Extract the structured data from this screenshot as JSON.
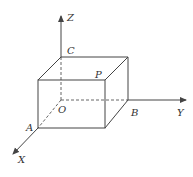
{
  "diagram": {
    "type": "3d-coordinate-box",
    "axes": {
      "z": "Z",
      "y": "Y",
      "x": "X"
    },
    "points": {
      "origin": "O",
      "a": "A",
      "b": "B",
      "c": "C",
      "p": "P"
    },
    "colors": {
      "line": "#444444",
      "background": "#ffffff"
    }
  }
}
